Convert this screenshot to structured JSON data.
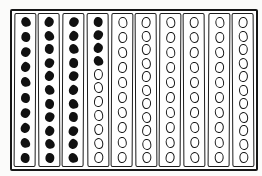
{
  "figure": {
    "kind": "hand-drawn-bean-counting-frame",
    "colors": {
      "ink": "#161616",
      "paper": "#ffffff",
      "background": "#fbfbfa"
    },
    "columns": [
      {
        "index": 1,
        "filled": 10,
        "open": 0
      },
      {
        "index": 2,
        "filled": 11,
        "open": 0
      },
      {
        "index": 3,
        "filled": 11,
        "open": 0
      },
      {
        "index": 4,
        "filled": 4,
        "open": 7
      },
      {
        "index": 5,
        "filled": 0,
        "open": 10
      },
      {
        "index": 6,
        "filled": 0,
        "open": 11
      },
      {
        "index": 7,
        "filled": 0,
        "open": 10
      },
      {
        "index": 8,
        "filled": 0,
        "open": 10
      },
      {
        "index": 9,
        "filled": 0,
        "open": 10
      },
      {
        "index": 10,
        "filled": 0,
        "open": 11
      }
    ],
    "totals": {
      "filled_beans": 36,
      "open_beans": 69,
      "columns": 10
    }
  }
}
